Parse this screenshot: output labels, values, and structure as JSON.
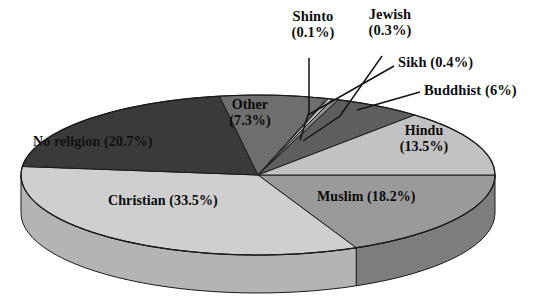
{
  "chart_data": {
    "type": "pie",
    "title": "",
    "subtitle": "",
    "xlabel": "",
    "ylabel": "",
    "legend_position": "none",
    "grid": false,
    "three_d": true,
    "unit": "%",
    "categories": [
      "Muslim",
      "Christian",
      "No religion",
      "Other",
      "Shinto",
      "Jewish",
      "Sikh",
      "Buddhist",
      "Hindu"
    ],
    "values": [
      18.2,
      33.5,
      20.7,
      7.3,
      0.1,
      0.3,
      0.4,
      6,
      13.5
    ],
    "slices": [
      {
        "name": "Muslim",
        "value": 18.2,
        "label": "Muslim (18.2%)",
        "color": "#9a9a9a",
        "side_color": "#7d7d7d",
        "label_placement": "inside",
        "text_tone": "on-light"
      },
      {
        "name": "Christian",
        "value": 33.5,
        "label": "Christian (33.5%)",
        "color": "#cfcfcf",
        "side_color": "#b4b4b4",
        "label_placement": "inside",
        "text_tone": "on-light"
      },
      {
        "name": "No religion",
        "value": 20.7,
        "label": "No religion (20.7%)",
        "color": "#3a3a3a",
        "side_color": "#2b2b2b",
        "label_placement": "inside",
        "text_tone": "on-dark"
      },
      {
        "name": "Other",
        "value": 7.3,
        "label": "Other\n(7.3%)",
        "color": "#6e6e6e",
        "side_color": "#5a5a5a",
        "label_placement": "inside",
        "text_tone": "on-light"
      },
      {
        "name": "Shinto",
        "value": 0.1,
        "label": "Shinto\n(0.1%)",
        "color": "#f2f2f2",
        "side_color": "#d8d8d8",
        "label_placement": "outside",
        "text_tone": "on-light"
      },
      {
        "name": "Jewish",
        "value": 0.3,
        "label": "Jewish\n(0.3%)",
        "color": "#bdbdbd",
        "side_color": "#a3a3a3",
        "label_placement": "outside",
        "text_tone": "on-light"
      },
      {
        "name": "Sikh",
        "value": 0.4,
        "label": "Sikh (0.4%)",
        "color": "#8c8c8c",
        "side_color": "#747474",
        "label_placement": "outside",
        "text_tone": "on-light"
      },
      {
        "name": "Buddhist",
        "value": 6,
        "label": "Buddhist (6%)",
        "color": "#5e5e5e",
        "side_color": "#4c4c4c",
        "label_placement": "outside",
        "text_tone": "on-light"
      },
      {
        "name": "Hindu",
        "value": 13.5,
        "label": "Hindu\n(13.5%)",
        "color": "#c2c2c2",
        "side_color": "#a6a6a6",
        "label_placement": "inside",
        "text_tone": "on-light"
      }
    ],
    "labels": {
      "shinto": "Shinto\n(0.1%)",
      "jewish": "Jewish\n(0.3%)",
      "sikh": "Sikh (0.4%)",
      "buddhist": "Buddhist (6%)",
      "other": "Other\n(7.3%)",
      "hindu": "Hindu\n(13.5%)",
      "muslim": "Muslim (18.2%)",
      "christian": "Christian (33.5%)",
      "no_religion": "No religion (20.7%)"
    },
    "colors": {
      "background": "#ffffff",
      "outline": "#1a1a1a",
      "leader_line": "#121212",
      "text": "#0d0d0d"
    }
  }
}
